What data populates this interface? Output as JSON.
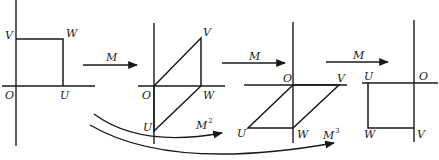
{
  "figure": {
    "colors": {
      "ink": "#1a1a1a",
      "background": "#ffffff"
    }
  },
  "panels": [
    {
      "name": "original",
      "labels": {
        "O": "O",
        "U": "U",
        "W": "W",
        "V": "V"
      },
      "shape": "square"
    },
    {
      "name": "after-M",
      "labels": {
        "O": "O",
        "U": "U",
        "W": "W",
        "V": "V"
      },
      "shape": "parallelogram"
    },
    {
      "name": "after-M2",
      "labels": {
        "O": "O",
        "U": "U",
        "W": "W",
        "V": "V"
      },
      "shape": "parallelogram"
    },
    {
      "name": "after-M3",
      "labels": {
        "O": "O",
        "U": "U",
        "W": "W",
        "V": "V"
      },
      "shape": "square"
    }
  ],
  "arrows": {
    "step1": {
      "label": "M"
    },
    "step2": {
      "label": "M"
    },
    "step3": {
      "label": "M"
    },
    "curve_m2": {
      "label": "M",
      "exponent": "2"
    },
    "curve_m3": {
      "label": "M",
      "exponent": "3"
    }
  }
}
